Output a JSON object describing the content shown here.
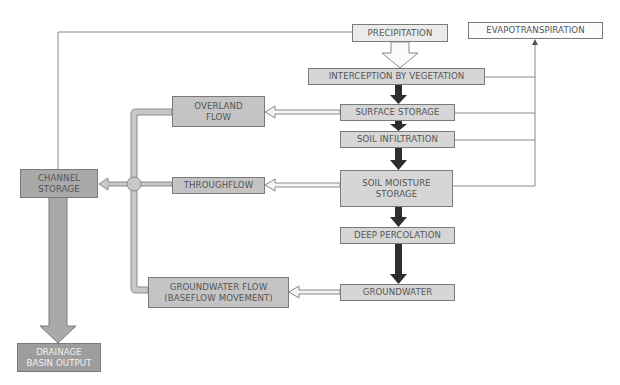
{
  "diagram": {
    "nodes": {
      "precipitation": "PRECIPITATION",
      "evapotranspiration": "EVAPOTRANSPIRATION",
      "interception": "INTERCEPTION BY VEGETATION",
      "surface_storage": "SURFACE STORAGE",
      "soil_infiltration": "SOIL INFILTRATION",
      "soil_moisture": "SOIL MOISTURE\nSTORAGE",
      "deep_percolation": "DEEP PERCOLATION",
      "groundwater": "GROUNDWATER",
      "overland_flow": "OVERLAND\nFLOW",
      "throughflow": "THROUGHFLOW",
      "groundwater_flow": "GROUNDWATER FLOW\n(BASEFLOW MOVEMENT)",
      "channel_storage": "CHANNEL\nSTORAGE",
      "drainage_output": "DRAINAGE\nBASIN OUTPUT"
    },
    "edges": [
      {
        "from": "precipitation",
        "to": "interception",
        "style": "hollow-wide-arrow"
      },
      {
        "from": "precipitation",
        "to": "channel_storage",
        "style": "thin-line"
      },
      {
        "from": "interception",
        "to": "surface_storage",
        "style": "dark-arrow"
      },
      {
        "from": "surface_storage",
        "to": "soil_infiltration",
        "style": "dark-arrow"
      },
      {
        "from": "soil_infiltration",
        "to": "soil_moisture",
        "style": "dark-arrow"
      },
      {
        "from": "soil_moisture",
        "to": "deep_percolation",
        "style": "dark-arrow"
      },
      {
        "from": "deep_percolation",
        "to": "groundwater",
        "style": "dark-arrow"
      },
      {
        "from": "surface_storage",
        "to": "overland_flow",
        "style": "hollow-arrow"
      },
      {
        "from": "soil_moisture",
        "to": "throughflow",
        "style": "hollow-arrow"
      },
      {
        "from": "groundwater",
        "to": "groundwater_flow",
        "style": "hollow-arrow"
      },
      {
        "from": "overland_flow",
        "to": "channel_storage",
        "style": "pipe"
      },
      {
        "from": "throughflow",
        "to": "channel_storage",
        "style": "pipe-arrow"
      },
      {
        "from": "groundwater_flow",
        "to": "channel_storage",
        "style": "pipe"
      },
      {
        "from": "channel_storage",
        "to": "drainage_output",
        "style": "wide-gray-arrow"
      },
      {
        "from": "interception",
        "to": "evapotranspiration",
        "style": "thin-line"
      },
      {
        "from": "surface_storage",
        "to": "evapotranspiration",
        "style": "thin-line"
      },
      {
        "from": "soil_infiltration",
        "to": "evapotranspiration",
        "style": "thin-line"
      },
      {
        "from": "soil_moisture",
        "to": "evapotranspiration",
        "style": "thin-arrow"
      }
    ]
  },
  "colors": {
    "dark_arrow": "#2b2b2b",
    "pipe_fill": "#c8c8c8",
    "line": "#777777"
  }
}
